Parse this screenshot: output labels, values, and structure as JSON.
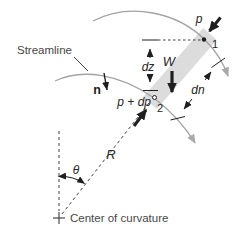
{
  "figure": {
    "type": "physics-diagram",
    "labels": {
      "streamline": "Streamline",
      "normal_vector": "n",
      "dz": "dz",
      "weight": "W",
      "pressure_point1": "p",
      "point1": "1",
      "pressure_point2": "p + dp",
      "point2": "2",
      "dn": "dn",
      "radius": "R",
      "angle": "θ",
      "center_of_curvature": "Center of curvature"
    },
    "colors": {
      "background": "#ffffff",
      "streamline_gray": "#a3a3a3",
      "fluid_element_band": "#dcdcdc",
      "ink": "#1f1f1f",
      "label_text": "#474747"
    }
  }
}
